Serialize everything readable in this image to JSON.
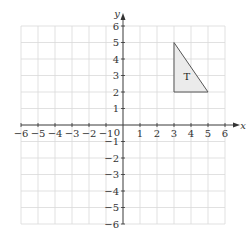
{
  "diagram": {
    "type": "coordinate-grid",
    "x_axis": {
      "label": "x",
      "min": -6,
      "max": 6,
      "ticks": [
        -6,
        -5,
        -4,
        -3,
        -2,
        -1,
        1,
        2,
        3,
        4,
        5,
        6
      ]
    },
    "y_axis": {
      "label": "y",
      "min": -6,
      "max": 6,
      "ticks": [
        -6,
        -5,
        -4,
        -3,
        -2,
        -1,
        1,
        2,
        3,
        4,
        5,
        6
      ]
    },
    "origin_label": "0",
    "grid": true,
    "shapes": [
      {
        "name": "triangle-T",
        "label": "T",
        "label_position": [
          3.75,
          3
        ],
        "vertices": [
          [
            3,
            5
          ],
          [
            3,
            2
          ],
          [
            5,
            2
          ]
        ],
        "fill": "#ebebeb",
        "stroke": "#555555"
      }
    ],
    "colors": {
      "grid": "#d9d9d9",
      "axis": "#333333"
    }
  }
}
